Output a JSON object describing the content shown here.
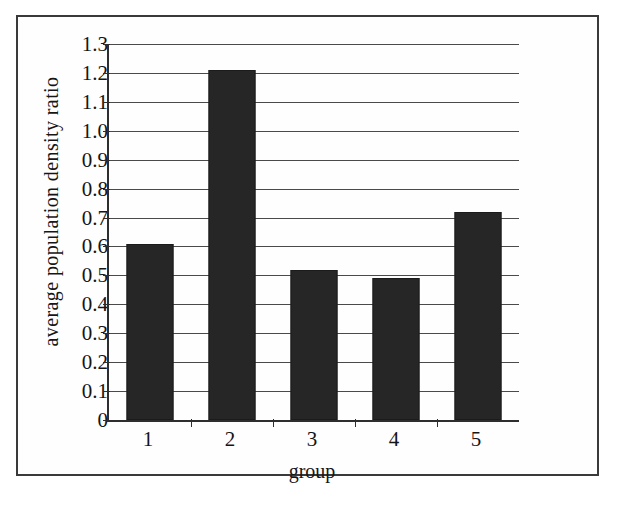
{
  "chart_data": {
    "type": "bar",
    "title": "",
    "subtitle": "",
    "xlabel": "group",
    "ylabel": "average population density ratio",
    "categories": [
      "1",
      "2",
      "3",
      "4",
      "5"
    ],
    "values": [
      0.61,
      1.21,
      0.52,
      0.49,
      0.72
    ],
    "series": [
      {
        "name": "average population density ratio",
        "values": [
          0.61,
          1.21,
          0.52,
          0.49,
          0.72
        ]
      }
    ],
    "ylim": [
      0,
      1.3
    ],
    "xlim": [
      0,
      5
    ],
    "y_ticks": [
      0,
      0.1,
      0.2,
      0.3,
      0.4,
      0.5,
      0.6,
      0.7,
      0.8,
      0.9,
      1.0,
      1.1,
      1.2,
      1.3
    ],
    "y_tick_labels": [
      "0",
      "0.1",
      "0.2",
      "0.3",
      "0.4",
      "0.5",
      "0.6",
      "0.7",
      "0.8",
      "0.9",
      "1.0",
      "1.1",
      "1.2",
      "1.3"
    ],
    "x_tick_labels": [
      "1",
      "2",
      "3",
      "4",
      "5"
    ],
    "grid": "horizontal",
    "legend": "none",
    "legend_position": "none",
    "annotations": [],
    "bar_color": "#262626",
    "axis_color": "#2e2e2e",
    "gridline_color": "#4a4a4a",
    "background_color": "#fefefe",
    "frame": true
  },
  "axis": {
    "y_title": "average population density ratio",
    "x_title": "group"
  }
}
